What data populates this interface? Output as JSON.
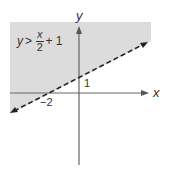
{
  "graph": {
    "x_axis_label": "x",
    "y_axis_label": "y",
    "y_intercept_label": "1",
    "x_intercept_label": "−2",
    "inequality": {
      "lhs": "y",
      "op": ">",
      "numerator": "x",
      "denominator": "2",
      "rest": "+ 1"
    },
    "boundary_style": "dashed",
    "shaded_region": "above line",
    "colors": {
      "shade": "#dcdcdc",
      "axis": "#555555",
      "line": "#222222"
    }
  }
}
